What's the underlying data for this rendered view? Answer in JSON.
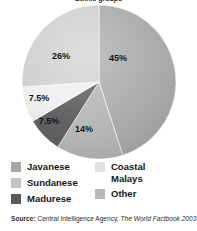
{
  "figure": {
    "title_fragment": "Ethnic groups",
    "background_color": "#ffffff"
  },
  "chart_data": {
    "type": "pie",
    "title": "Ethnic groups",
    "categories": [
      "Javanese",
      "Sundanese",
      "Madurese",
      "Coastal Malays",
      "Other"
    ],
    "values": [
      45,
      14,
      7.5,
      7.5,
      26
    ],
    "value_labels": [
      "45%",
      "14%",
      "7.5%",
      "7.5%",
      "26%"
    ],
    "unit": "percent",
    "colors": [
      "#a8a8a8",
      "#b4b4b4",
      "#595959",
      "#eeeeee",
      "#cfcfcf"
    ],
    "start_angle_deg": 0,
    "direction": "clockwise",
    "legend_position": "bottom",
    "grid": false,
    "xlabel": "",
    "ylabel": "",
    "slices": [
      {
        "label": "Javanese",
        "value": 45,
        "display": "45%",
        "color": "#a8a8a8",
        "start_deg": 0,
        "end_deg": 162
      },
      {
        "label": "Sundanese",
        "value": 14,
        "display": "14%",
        "color": "#b4b4b4",
        "start_deg": 162,
        "end_deg": 212.4
      },
      {
        "label": "Madurese",
        "value": 7.5,
        "display": "7.5%",
        "color": "#595959",
        "start_deg": 212.4,
        "end_deg": 239.4
      },
      {
        "label": "Coastal Malays",
        "value": 7.5,
        "display": "7.5%",
        "color": "#eeeeee",
        "start_deg": 239.4,
        "end_deg": 266.4
      },
      {
        "label": "Other",
        "value": 26,
        "display": "26%",
        "color": "#cfcfcf",
        "start_deg": 266.4,
        "end_deg": 360
      }
    ]
  },
  "legend": {
    "left_column": [
      {
        "label": "Javanese",
        "color": "#a8a8a8"
      },
      {
        "label": "Sundanese",
        "color": "#c4c4c4"
      },
      {
        "label": "Madurese",
        "color": "#595959"
      }
    ],
    "right_column": [
      {
        "label": "Coastal\nMalays",
        "color": "#e2e2e2"
      },
      {
        "label": "Other",
        "color": "#b8b8b8"
      }
    ]
  },
  "source": {
    "label": "Source:",
    "body": " Central Intelligence Agency, ",
    "title": "The World Factbook 2003"
  }
}
